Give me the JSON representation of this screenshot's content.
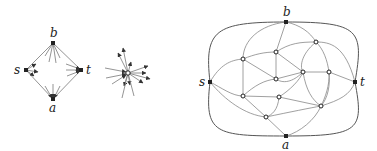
{
  "figure": {
    "diamond": {
      "labels": {
        "s": "s",
        "b": "b",
        "t": "t",
        "a": "a"
      },
      "nodes": {
        "s": [
          26,
          70
        ],
        "b": [
          53,
          43
        ],
        "t": [
          81,
          70
        ],
        "a": [
          53,
          99
        ]
      }
    },
    "star": {
      "center": [
        128,
        73
      ]
    },
    "graph": {
      "labels": {
        "s": "s",
        "b": "b",
        "t": "t",
        "a": "a"
      },
      "terminals": {
        "s": [
          210,
          82
        ],
        "b": [
          286,
          22
        ],
        "t": [
          355,
          82
        ],
        "a": [
          286,
          136
        ]
      },
      "inner_nodes": [
        [
          243,
          59
        ],
        [
          276,
          52
        ],
        [
          316,
          42
        ],
        [
          276,
          79
        ],
        [
          303,
          72
        ],
        [
          329,
          72
        ],
        [
          243,
          96
        ],
        [
          279,
          97
        ],
        [
          321,
          106
        ],
        [
          266,
          117
        ]
      ]
    },
    "colors": {
      "edge": "#888888",
      "outer": "#555555",
      "node": "#222222"
    }
  }
}
